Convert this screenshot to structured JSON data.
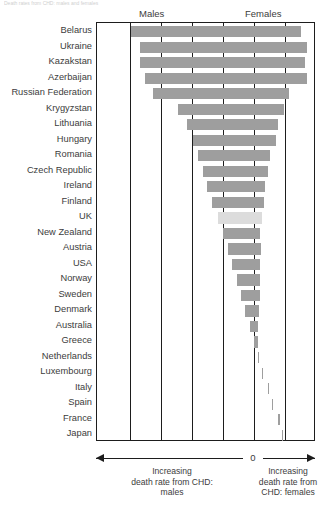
{
  "caption_sliver": "Death rates from CHD: males and females",
  "headers": {
    "males": "Males",
    "females": "Females"
  },
  "axis": {
    "zero_label": "0",
    "left_annotation_line1": "Increasing",
    "left_annotation_line2": "death rate from CHD:",
    "left_annotation_line3": "males",
    "right_annotation_line1": "Increasing",
    "right_annotation_line2": "death rate from",
    "right_annotation_line3": "CHD: females"
  },
  "colors": {
    "bar": "#9e9e9e",
    "bar_highlight": "#dcdcdc",
    "axis": "#1d1d1d",
    "text": "#3c3c3c"
  },
  "chart_data": {
    "type": "bar",
    "orientation": "horizontal",
    "title": "Death rates from CHD: males and females",
    "xlabel": "",
    "ylabel": "",
    "grid": true,
    "gridlines_x": [
      -5,
      -4,
      -3,
      -2,
      -1,
      0,
      1
    ],
    "xlim": [
      -5.2,
      1.9
    ],
    "legend": "none",
    "note": "Floating horizontal bars. Left edge = male death rate (increasing to the left of 0), right edge = female death rate (increasing to the right of 0). UK bar is highlighted in lighter grey.",
    "categories": [
      "Belarus",
      "Ukraine",
      "Kazakstan",
      "Azerbaijan",
      "Russian Federation",
      "Krygyzstan",
      "Lithuania",
      "Hungary",
      "Romania",
      "Czech Republic",
      "Ireland",
      "Finland",
      "UK",
      "New Zealand",
      "Austria",
      "USA",
      "Norway",
      "Sweden",
      "Denmark",
      "Australia",
      "Greece",
      "Netherlands",
      "Luxembourg",
      "Italy",
      "Spain",
      "France",
      "Japan"
    ],
    "series": [
      {
        "name": "Male death rate from CHD (bar left edge)",
        "values": [
          -4.9,
          -4.62,
          -4.62,
          -4.46,
          -4.2,
          -3.39,
          -3.11,
          -2.92,
          -2.75,
          -2.58,
          -2.46,
          -2.3,
          -2.13,
          -1.97,
          -1.8,
          -1.67,
          -1.53,
          -1.4,
          -1.26,
          -1.12,
          -0.99,
          -0.86,
          -0.73,
          -0.55,
          -0.42,
          -0.22,
          -0.1
        ]
      },
      {
        "name": "Female death rate from CHD (bar right edge)",
        "values": [
          1.53,
          1.72,
          1.66,
          1.75,
          1.15,
          1.07,
          0.86,
          0.81,
          0.62,
          0.55,
          0.45,
          0.4,
          0.33,
          0.28,
          0.3,
          0.26,
          0.26,
          0.26,
          0.23,
          0.21,
          0.2,
          0.2,
          0.21,
          0.13,
          0.1,
          0.08,
          0.06
        ]
      }
    ],
    "highlighted_category": "UK"
  },
  "bars": [
    {
      "label": "Belarus",
      "left": 130.0,
      "right": 300.0,
      "highlight": false
    },
    {
      "label": "Ukraine",
      "left": 138.5,
      "right": 305.5,
      "highlight": false
    },
    {
      "label": "Kazakstan",
      "left": 138.5,
      "right": 303.5,
      "highlight": false
    },
    {
      "label": "Azerbaijan",
      "left": 143.5,
      "right": 306.0,
      "highlight": false
    },
    {
      "label": "Russian Federation",
      "left": 151.5,
      "right": 288.0,
      "highlight": false
    },
    {
      "label": "Krygyzstan",
      "left": 176.5,
      "right": 283.0,
      "highlight": false
    },
    {
      "label": "Lithuania",
      "left": 185.5,
      "right": 276.5,
      "highlight": false
    },
    {
      "label": "Hungary",
      "left": 191.5,
      "right": 275.0,
      "highlight": false
    },
    {
      "label": "Romania",
      "left": 197.0,
      "right": 269.0,
      "highlight": false
    },
    {
      "label": "Czech Republic",
      "left": 202.0,
      "right": 267.0,
      "highlight": false
    },
    {
      "label": "Ireland",
      "left": 206.0,
      "right": 264.0,
      "highlight": false
    },
    {
      "label": "Finland",
      "left": 211.0,
      "right": 262.5,
      "highlight": false
    },
    {
      "label": "UK",
      "left": 216.5,
      "right": 260.5,
      "highlight": true
    },
    {
      "label": "New Zealand",
      "left": 221.5,
      "right": 259.0,
      "highlight": false
    },
    {
      "label": "Austria",
      "left": 227.0,
      "right": 259.5,
      "highlight": false
    },
    {
      "label": "USA",
      "left": 231.0,
      "right": 258.5,
      "highlight": false
    },
    {
      "label": "Norway",
      "left": 235.5,
      "right": 258.5,
      "highlight": false
    },
    {
      "label": "Sweden",
      "left": 239.5,
      "right": 258.5,
      "highlight": false
    },
    {
      "label": "Denmark",
      "left": 244.0,
      "right": 257.5,
      "highlight": false
    },
    {
      "label": "Australia",
      "left": 248.5,
      "right": 257.0,
      "highlight": false
    },
    {
      "label": "Greece",
      "left": 252.5,
      "right": 256.5,
      "highlight": false
    },
    {
      "label": "Netherlands",
      "left": 256.5,
      "right": 256.5,
      "highlight": false
    },
    {
      "label": "Luxembourg",
      "left": 260.5,
      "right": 257.0,
      "highlight": false
    },
    {
      "label": "Italy",
      "left": 266.5,
      "right": 254.0,
      "highlight": false
    },
    {
      "label": "Spain",
      "left": 270.5,
      "right": 253.0,
      "highlight": false
    },
    {
      "label": "France",
      "left": 277.0,
      "right": 252.5,
      "highlight": false
    },
    {
      "label": "Japan",
      "left": 280.5,
      "right": 252.0,
      "highlight": false
    }
  ],
  "gridlines": [
    129.0,
    160.0,
    191.0,
    222.0,
    284.0
  ],
  "zero_x": 253.0
}
